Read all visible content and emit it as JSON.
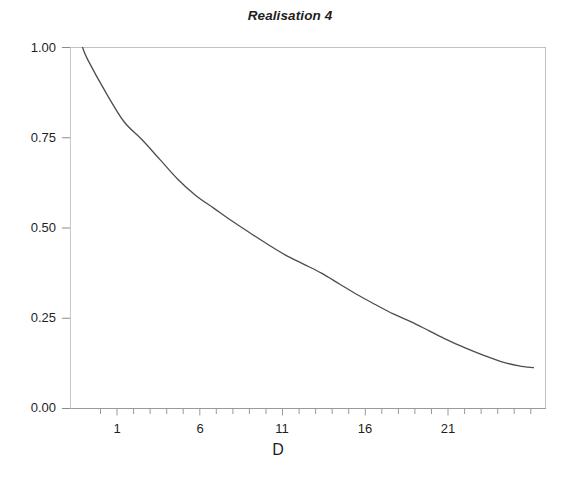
{
  "chart_data": {
    "type": "line",
    "title": "Realisation 4",
    "xlabel": "D",
    "ylabel": "",
    "xlim": [
      0,
      26.5
    ],
    "ylim": [
      0.0,
      1.0
    ],
    "grid": false,
    "legend": null,
    "xticks": [
      1,
      6,
      11,
      16,
      21
    ],
    "xtick_labels": [
      "1",
      "6",
      "11",
      "16",
      "21"
    ],
    "xminor_tick_step": 1,
    "yticks": [
      0.0,
      0.25,
      0.5,
      0.75,
      1.0
    ],
    "ytick_labels": [
      "0.00",
      "0.25",
      "0.50",
      "0.75",
      "1.00"
    ],
    "line_color": "#4d4d4d",
    "line_width": 1.3,
    "x": [
      0.7,
      1,
      2,
      3,
      4,
      5,
      6,
      7,
      8,
      9,
      10,
      11,
      12,
      13,
      14,
      15,
      16,
      17,
      18,
      19,
      20,
      21,
      22,
      23,
      24,
      25,
      25.8
    ],
    "values": [
      1.0,
      0.965,
      0.875,
      0.795,
      0.745,
      0.69,
      0.635,
      0.59,
      0.555,
      0.52,
      0.487,
      0.455,
      0.425,
      0.4,
      0.375,
      0.345,
      0.315,
      0.288,
      0.262,
      0.24,
      0.215,
      0.19,
      0.168,
      0.148,
      0.13,
      0.118,
      0.113
    ],
    "series": [
      {
        "name": "Realisation 4",
        "values": [
          1.0,
          0.965,
          0.875,
          0.795,
          0.745,
          0.69,
          0.635,
          0.59,
          0.555,
          0.52,
          0.487,
          0.455,
          0.425,
          0.4,
          0.375,
          0.345,
          0.315,
          0.288,
          0.262,
          0.24,
          0.215,
          0.19,
          0.168,
          0.148,
          0.13,
          0.118,
          0.113
        ]
      }
    ],
    "axes_frame": {
      "left": false,
      "top": true,
      "right": true,
      "bottom": true,
      "frame_color": "#b8b8b8"
    }
  },
  "axis_labels": {
    "y": [
      "1.00",
      "0.75",
      "0.50",
      "0.25",
      "0.00"
    ],
    "x": [
      "1",
      "6",
      "11",
      "16",
      "21"
    ],
    "x_title": "D"
  }
}
